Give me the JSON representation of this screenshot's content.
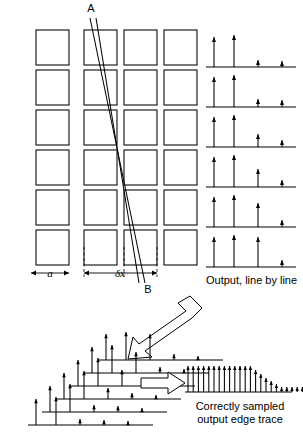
{
  "figure": {
    "background_color": "#ffffff",
    "ink_color": "#000000",
    "labels": {
      "point_a": "A",
      "point_b": "B",
      "pitch_a": "a",
      "pitch_dx": "δx",
      "output_line_by_line": "Output, line by line",
      "caption_line1": "Correctly sampled",
      "caption_line2": "output edge trace"
    }
  },
  "grid": {
    "name": "detector-element-array",
    "columns": 4,
    "rows": 6,
    "column_x": [
      36,
      84,
      124,
      164
    ],
    "row_y": [
      30,
      70,
      110,
      150,
      190,
      230
    ],
    "cell_width": 33,
    "cell_height": 35,
    "column_gap_label": "a",
    "pitch_label": "δx",
    "dashed_marker_columns": [
      84,
      124
    ]
  },
  "edge_line": {
    "name": "diagonal-edge-A-B",
    "from_label": "A",
    "to_label": "B",
    "a_point": [
      90,
      18
    ],
    "b_point": [
      145,
      283
    ],
    "second_a_point": [
      96,
      18
    ],
    "second_b_point": [
      139,
      283
    ]
  },
  "output_rows": {
    "name": "output-line-by-line",
    "count": 6,
    "baseline_x_start": 206,
    "baseline_x_end": 296,
    "baseline_y": [
      67,
      107,
      147,
      187,
      227,
      267
    ],
    "arrow_x_offsets": [
      8,
      28,
      52,
      76
    ],
    "caption": "Output, line by line",
    "series": [
      {
        "line": 1,
        "heights": [
          30,
          32,
          7,
          6
        ]
      },
      {
        "line": 2,
        "heights": [
          30,
          32,
          8,
          7
        ]
      },
      {
        "line": 3,
        "heights": [
          30,
          32,
          13,
          7
        ]
      },
      {
        "line": 4,
        "heights": [
          30,
          32,
          18,
          7
        ]
      },
      {
        "line": 5,
        "heights": [
          30,
          32,
          24,
          7
        ]
      },
      {
        "line": 6,
        "heights": [
          30,
          32,
          30,
          7
        ]
      }
    ]
  },
  "stacked_stack": {
    "name": "stacked-line-traces",
    "count": 6,
    "baseline_length": 125,
    "step_dx": 14,
    "step_dy": -13,
    "origin": [
      28,
      425
    ],
    "arrow_x_offsets": [
      8,
      28,
      52,
      76,
      100
    ],
    "series": [
      {
        "line": 1,
        "heights": [
          26,
          28,
          6,
          5,
          4
        ]
      },
      {
        "line": 2,
        "heights": [
          26,
          28,
          7,
          6,
          4
        ]
      },
      {
        "line": 3,
        "heights": [
          26,
          28,
          11,
          6,
          4
        ]
      },
      {
        "line": 4,
        "heights": [
          26,
          28,
          16,
          6,
          4
        ]
      },
      {
        "line": 5,
        "heights": [
          26,
          28,
          21,
          6,
          4
        ]
      },
      {
        "line": 6,
        "heights": [
          26,
          28,
          26,
          6,
          4
        ]
      }
    ]
  },
  "edge_trace": {
    "name": "correctly-sampled-output-edge-trace",
    "baseline_x_start": 188,
    "baseline_x_end": 292,
    "baseline_y": 392,
    "sample_spacing": 5.2,
    "caption_line1": "Correctly sampled",
    "caption_line2": "output edge trace",
    "heights": [
      26,
      26,
      26,
      26,
      26,
      26,
      26,
      26,
      26,
      26,
      26,
      26,
      26,
      22,
      18,
      14,
      11,
      8,
      5,
      5,
      5,
      5,
      5,
      5,
      5,
      5
    ]
  },
  "block_arrows": [
    {
      "name": "arrow-grid-to-stack",
      "direction": "down-left",
      "x1": 196,
      "y1": 298,
      "x2": 130,
      "y2": 345
    },
    {
      "name": "arrow-stack-to-trace",
      "direction": "right",
      "x1": 143,
      "y1": 383,
      "x2": 186,
      "y2": 383
    }
  ]
}
